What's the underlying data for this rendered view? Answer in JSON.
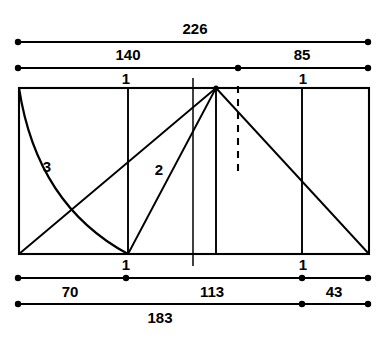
{
  "figure": {
    "type": "technical-dimension-diagram",
    "background_color": "#ffffff",
    "line_color": "#000000"
  },
  "dimensions": {
    "top_overall": {
      "label": "226",
      "value": 226
    },
    "top_left_segment": {
      "label": "140",
      "value": 140
    },
    "top_right_segment": {
      "label": "85",
      "value": 85
    },
    "bottom_left_segment": {
      "label": "70",
      "value": 70
    },
    "bottom_middle_segment": {
      "label": "113",
      "value": 113
    },
    "bottom_right_segment": {
      "label": "43",
      "value": 43
    },
    "bottom_overall": {
      "label": "183",
      "value": 183
    }
  },
  "station_marks": {
    "top_left_mark": "1",
    "top_right_mark": "1",
    "bottom_left_mark": "1",
    "bottom_right_mark": "1"
  },
  "curve_labels": {
    "curve_three": "3",
    "curve_two": "2"
  }
}
